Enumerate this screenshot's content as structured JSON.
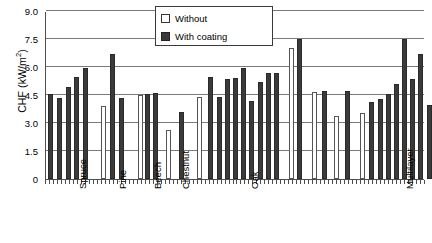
{
  "chart_data": {
    "type": "bar",
    "title": "",
    "xlabel": "",
    "ylabel": "CHF (kW/m2)",
    "ylabel_display": "CHF (kW/m",
    "ylabel_sup": "2",
    "ylabel_tail": ")",
    "ylim": [
      0,
      9.0
    ],
    "yticks": [
      "0",
      "1.5",
      "3.0",
      "4.5",
      "6.0",
      "7.5",
      "9.0"
    ],
    "ytick_values": [
      0,
      1.5,
      3.0,
      4.5,
      6.0,
      7.5,
      9.0
    ],
    "grid": true,
    "legend_position": "top-center",
    "legend": [
      {
        "label": "Without",
        "swatch": "#ffffff",
        "border": "#555555"
      },
      {
        "label": "With coating",
        "swatch": "#3a3a3a",
        "border": "#2a2a2a"
      }
    ],
    "categories": [
      "Spruce",
      "Pine",
      "Beech",
      "Chestnut",
      "Oak",
      "Multilayer"
    ],
    "bars": [
      {
        "x": 2,
        "value": 4.55,
        "series": "With coating"
      },
      {
        "x": 11,
        "value": 4.35,
        "series": "With coating"
      },
      {
        "x": 20,
        "value": 4.95,
        "series": "With coating"
      },
      {
        "x": 28,
        "value": 5.45,
        "series": "With coating"
      },
      {
        "x": 37,
        "value": 5.95,
        "series": "With coating"
      },
      {
        "x": 55,
        "value": 3.9,
        "series": "Without"
      },
      {
        "x": 64,
        "value": 6.7,
        "series": "With coating"
      },
      {
        "x": 73,
        "value": 4.35,
        "series": "With coating"
      },
      {
        "x": 92,
        "value": 4.5,
        "series": "Without"
      },
      {
        "x": 99,
        "value": 4.55,
        "series": "With coating"
      },
      {
        "x": 107,
        "value": 4.6,
        "series": "With coating"
      },
      {
        "x": 120,
        "value": 2.6,
        "series": "Without"
      },
      {
        "x": 133,
        "value": 3.6,
        "series": "With coating"
      },
      {
        "x": 151,
        "value": 4.4,
        "series": "Without"
      },
      {
        "x": 162,
        "value": 5.45,
        "series": "With coating"
      },
      {
        "x": 171,
        "value": 4.4,
        "series": "With coating"
      },
      {
        "x": 179,
        "value": 5.35,
        "series": "With coating"
      },
      {
        "x": 187,
        "value": 5.4,
        "series": "With coating"
      },
      {
        "x": 195,
        "value": 5.95,
        "series": "With coating"
      },
      {
        "x": 203,
        "value": 4.2,
        "series": "With coating"
      },
      {
        "x": 212,
        "value": 5.2,
        "series": "With coating"
      },
      {
        "x": 220,
        "value": 5.7,
        "series": "With coating"
      },
      {
        "x": 228,
        "value": 5.7,
        "series": "With coating"
      },
      {
        "x": 243,
        "value": 7.0,
        "series": "Without"
      },
      {
        "x": 251,
        "value": 7.5,
        "series": "With coating"
      },
      {
        "x": 266,
        "value": 4.65,
        "series": "Without"
      },
      {
        "x": 276,
        "value": 4.7,
        "series": "With coating"
      },
      {
        "x": 288,
        "value": 3.35,
        "series": "Without"
      },
      {
        "x": 299,
        "value": 4.7,
        "series": "With coating"
      },
      {
        "x": 314,
        "value": 3.55,
        "series": "Without"
      },
      {
        "x": 323,
        "value": 4.1,
        "series": "With coating"
      },
      {
        "x": 332,
        "value": 4.3,
        "series": "With coating"
      },
      {
        "x": 340,
        "value": 4.55,
        "series": "With coating"
      },
      {
        "x": 348,
        "value": 5.1,
        "series": "With coating"
      },
      {
        "x": 356,
        "value": 7.5,
        "series": "With coating"
      },
      {
        "x": 364,
        "value": 5.35,
        "series": "With coating"
      },
      {
        "x": 372,
        "value": 6.7,
        "series": "With coating"
      },
      {
        "x": 381,
        "value": 3.95,
        "series": "With coating"
      },
      {
        "x": 392,
        "value": 5.5,
        "series": "With coating"
      },
      {
        "x": 400,
        "value": 5.55,
        "series": "With coating"
      },
      {
        "x": 410,
        "value": 5.5,
        "series": "With coating"
      }
    ],
    "group_label_positions": [
      {
        "label": "Spruce",
        "x": 28
      },
      {
        "label": "Pine",
        "x": 68
      },
      {
        "label": "Beech",
        "x": 103
      },
      {
        "label": "Chestnut",
        "x": 131
      },
      {
        "label": "Oak",
        "x": 200
      },
      {
        "label": "Multilayer",
        "x": 355
      }
    ]
  }
}
